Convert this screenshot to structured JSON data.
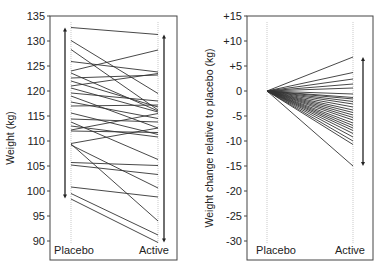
{
  "chart_data": [
    {
      "type": "line",
      "title": "",
      "xlabel": "",
      "ylabel": "Weight (kg)",
      "categories": [
        "Placebo",
        "Active"
      ],
      "ylim": [
        88,
        135
      ],
      "yticks": [
        90,
        95,
        100,
        105,
        110,
        115,
        120,
        125,
        130,
        135
      ],
      "ytick_labels": [
        "90",
        "95",
        "100",
        "105",
        "110",
        "115",
        "120",
        "125",
        "130",
        "135"
      ],
      "grid": false,
      "legend": null,
      "range_arrows": {
        "placebo": {
          "from": 98.5,
          "to": 132.7
        },
        "active": {
          "from": 89.7,
          "to": 131.3
        }
      },
      "series": [
        {
          "name": "subject-1",
          "values": [
            132.7,
            131.3
          ]
        },
        {
          "name": "subject-2",
          "values": [
            130.1,
            119.5
          ]
        },
        {
          "name": "subject-3",
          "values": [
            128.3,
            116.2
          ]
        },
        {
          "name": "subject-4",
          "values": [
            125.9,
            123.8
          ]
        },
        {
          "name": "subject-5",
          "values": [
            124.0,
            128.2
          ]
        },
        {
          "name": "subject-6",
          "values": [
            123.6,
            116.0
          ]
        },
        {
          "name": "subject-7",
          "values": [
            122.6,
            123.2
          ]
        },
        {
          "name": "subject-8",
          "values": [
            122.0,
            116.8
          ]
        },
        {
          "name": "subject-9",
          "values": [
            121.0,
            123.5
          ]
        },
        {
          "name": "subject-10",
          "values": [
            120.6,
            115.8
          ]
        },
        {
          "name": "subject-11",
          "values": [
            119.6,
            118.0
          ]
        },
        {
          "name": "subject-12",
          "values": [
            119.0,
            112.6
          ]
        },
        {
          "name": "subject-13",
          "values": [
            117.8,
            114.5
          ]
        },
        {
          "name": "subject-14",
          "values": [
            117.0,
            117.2
          ]
        },
        {
          "name": "subject-15",
          "values": [
            115.6,
            111.3
          ]
        },
        {
          "name": "subject-16",
          "values": [
            114.4,
            113.8
          ]
        },
        {
          "name": "subject-17",
          "values": [
            113.8,
            106.3
          ]
        },
        {
          "name": "subject-18",
          "values": [
            113.0,
            110.8
          ]
        },
        {
          "name": "subject-19",
          "values": [
            112.2,
            115.5
          ]
        },
        {
          "name": "subject-20",
          "values": [
            112.0,
            111.7
          ]
        },
        {
          "name": "subject-21",
          "values": [
            109.5,
            112.6
          ]
        },
        {
          "name": "subject-22",
          "values": [
            109.2,
            100.6
          ]
        },
        {
          "name": "subject-23",
          "values": [
            109.4,
            94.0
          ]
        },
        {
          "name": "subject-24",
          "values": [
            105.7,
            105.1
          ]
        },
        {
          "name": "subject-25",
          "values": [
            105.2,
            103.3
          ]
        },
        {
          "name": "subject-26",
          "values": [
            100.8,
            98.8
          ]
        },
        {
          "name": "subject-27",
          "values": [
            99.5,
            91.2
          ]
        },
        {
          "name": "subject-28",
          "values": [
            98.4,
            89.7
          ]
        }
      ]
    },
    {
      "type": "line",
      "title": "",
      "xlabel": "",
      "ylabel": "Weight change relative to placebo (kg)",
      "categories": [
        "Placebo",
        "Active"
      ],
      "ylim": [
        -32,
        15
      ],
      "yticks": [
        15,
        10,
        5,
        0,
        -5,
        -10,
        -15,
        -20,
        -25,
        -30
      ],
      "ytick_labels": [
        "+15",
        "+10",
        "+5",
        "0",
        "-5",
        "-10",
        "-15",
        "-20",
        "-25",
        "-30"
      ],
      "grid": false,
      "legend": null,
      "range_arrow": {
        "from": -15.0,
        "to": 6.8
      },
      "series_active_values": [
        6.8,
        3.7,
        2.4,
        1.4,
        0.6,
        -0.6,
        -1.3,
        -1.6,
        -2.1,
        -2.6,
        -3.2,
        -3.8,
        -4.3,
        -4.8,
        -5.3,
        -5.8,
        -6.4,
        -6.9,
        -7.4,
        -7.9,
        -8.5,
        -9.2,
        -10.0,
        -10.7,
        -15.0
      ],
      "placebo_value": 0
    }
  ],
  "left_panel": {
    "ylabel": "Weight (kg)",
    "x_categories": [
      "Placebo",
      "Active"
    ]
  },
  "right_panel": {
    "ylabel": "Weight change relative to placebo (kg)",
    "x_categories": [
      "Placebo",
      "Active"
    ]
  }
}
